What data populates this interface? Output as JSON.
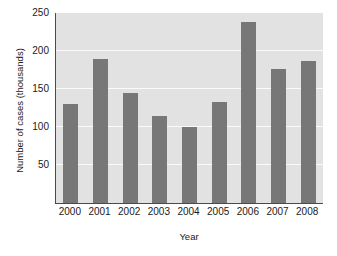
{
  "chart_data": {
    "type": "bar",
    "title": "",
    "xlabel": "Year",
    "ylabel": "Number of cases (thousands)",
    "categories": [
      "2000",
      "2001",
      "2002",
      "2003",
      "2004",
      "2005",
      "2006",
      "2007",
      "2008"
    ],
    "values": [
      130,
      190,
      145,
      114,
      100,
      133,
      238,
      176,
      187
    ],
    "ylim": [
      0,
      250
    ],
    "yticks": [
      50,
      100,
      150,
      200,
      250
    ],
    "ytick_labels": [
      "50",
      "100",
      "150",
      "200",
      "250"
    ],
    "grid": true,
    "grid_axis": "y",
    "grid_color": "#fafafa",
    "legend": false,
    "legend_position": "none",
    "bar_color": "#777777",
    "plot_background": "#e2e2e2",
    "figure_background": "#ffffff",
    "axis_color": "#4a4a4a",
    "text_color": "#1a1a1a"
  }
}
